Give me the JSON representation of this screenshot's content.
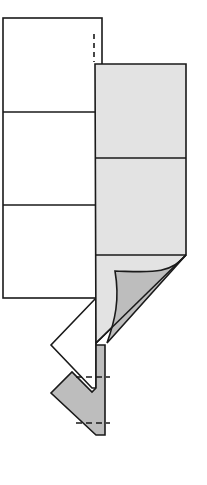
{
  "diagram": {
    "type": "origami-fold-step",
    "colors": {
      "paper_front": "#ffffff",
      "paper_back": "#e3e3e3",
      "paper_back_dark": "#bdbdbd",
      "stroke": "#1a1a1a"
    },
    "elements": [
      {
        "name": "white-panel",
        "sections": 3
      },
      {
        "name": "gray-panel",
        "sections": 3
      },
      {
        "name": "page-curl"
      },
      {
        "name": "white-flap"
      },
      {
        "name": "gray-flap"
      },
      {
        "name": "fold-guide-dashed"
      }
    ]
  }
}
